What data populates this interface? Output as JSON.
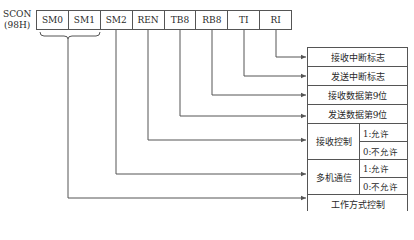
{
  "register": {
    "name": "SCON",
    "address": "(98H)",
    "bits": [
      "SM0",
      "SM1",
      "SM2",
      "REN",
      "TB8",
      "RB8",
      "TI",
      "RI"
    ]
  },
  "descriptions": {
    "ri": "接收中断标志",
    "ti": "发送中断标志",
    "rb8": "接收数据第9位",
    "tb8": "发送数据第9位",
    "ren": {
      "label": "接收控制",
      "opt1": "1:允许",
      "opt0": "0:不允许"
    },
    "sm2": {
      "label": "多机通信",
      "opt1": "1:允许",
      "opt0": "0:不允许"
    },
    "sm01": "工作方式控制"
  },
  "colors": {
    "line": "#555555",
    "text": "#2a2a2a"
  }
}
